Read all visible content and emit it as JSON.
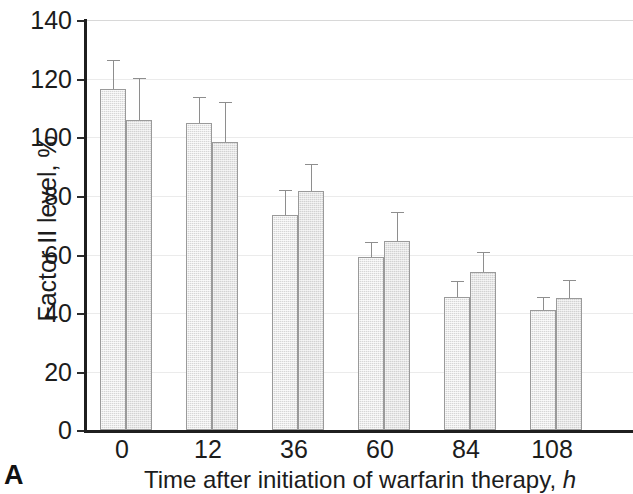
{
  "panel": {
    "letter": "A"
  },
  "chart_data": {
    "type": "bar",
    "title": "",
    "xlabel": "Time after initiation of warfarin therapy,",
    "xlabel_unit": "h",
    "ylabel": "Factor II level, %",
    "categories": [
      "0",
      "12",
      "36",
      "60",
      "84",
      "108"
    ],
    "ylim": [
      0,
      140
    ],
    "yticks": [
      "0",
      "20",
      "40",
      "60",
      "80",
      "100",
      "120",
      "140"
    ],
    "grid": true,
    "legend": "none",
    "series": [
      {
        "name": "series-1",
        "values": [
          116.5,
          105,
          73.5,
          59,
          45.5,
          41
        ],
        "errors": [
          9.5,
          8.5,
          8,
          5,
          5,
          4
        ]
      },
      {
        "name": "series-2",
        "values": [
          106,
          98.5,
          81.5,
          64.5,
          54,
          45
        ],
        "errors": [
          14,
          13,
          9,
          9.5,
          6.5,
          6
        ]
      }
    ]
  }
}
